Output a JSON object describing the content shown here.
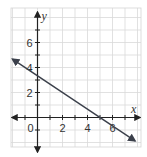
{
  "chart_data": {
    "type": "line",
    "title": "",
    "xlabel": "x",
    "ylabel": "y",
    "xlim": [
      -2,
      8
    ],
    "ylim": [
      -2.4,
      8.8
    ],
    "grid": true,
    "grid_step": 1,
    "x_ticks": [
      -1,
      0,
      1,
      2,
      3,
      4,
      5,
      6,
      7
    ],
    "x_tick_labels": [
      "0",
      "2",
      "4",
      "6"
    ],
    "x_tick_label_values": [
      0,
      2,
      4,
      6
    ],
    "y_ticks": [
      -1,
      1,
      2,
      3,
      4,
      5,
      6,
      7
    ],
    "y_tick_labels": [
      "2",
      "4",
      "6"
    ],
    "y_tick_label_values": [
      2,
      4,
      6
    ],
    "series": [
      {
        "name": "line",
        "equation": "y = -2/3 x + 10/3",
        "slope": -0.6667,
        "intercept": 3.333,
        "x": [
          -2.0,
          7.8
        ],
        "y": [
          4.67,
          -1.87
        ],
        "arrows": "both",
        "color": "#3a3f4a"
      }
    ]
  }
}
